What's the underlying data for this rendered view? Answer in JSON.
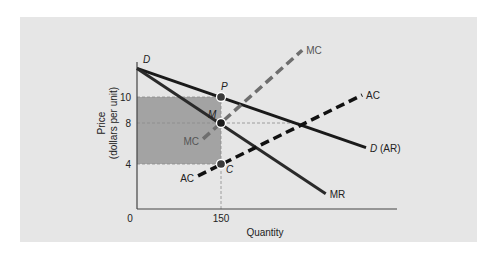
{
  "chart_data": {
    "type": "line",
    "title": "",
    "xlabel": "Quantity",
    "ylabel": [
      "Price",
      "(dollars per unit)"
    ],
    "xlim": [
      0,
      465
    ],
    "ylim": [
      0,
      13.8
    ],
    "x_ticks": [
      {
        "value": 0,
        "label": "0"
      },
      {
        "value": 150,
        "label": "150"
      }
    ],
    "y_ticks": [
      {
        "value": 10,
        "label": "10"
      },
      {
        "value": 8,
        "label": "8"
      },
      {
        "value": 4,
        "label": "4"
      }
    ],
    "grid": false,
    "colors": {
      "panel": "#e6e6e6",
      "shade": "#a3a3a3",
      "axis": "#444444",
      "demand": "#1a1a1a",
      "mr": "#2a2a2a",
      "mc": "#6e6e6e",
      "ac": "#111111",
      "guide": "#8a8a8a",
      "point": "#3a3a3a"
    },
    "series": [
      {
        "name": "D (AR)",
        "key": "demand",
        "style": "solid",
        "points": [
          [
            0,
            12.2
          ],
          [
            409,
            5.6
          ]
        ],
        "label": "D (AR)",
        "label_anchor": "end"
      },
      {
        "name": "MR",
        "key": "mr",
        "style": "solid",
        "points": [
          [
            0,
            12.2
          ],
          [
            337,
            1.35
          ]
        ],
        "label": "MR",
        "label_anchor": "end"
      },
      {
        "name": "MC",
        "key": "mc",
        "style": "dashed",
        "points": [
          [
            118,
            6.45
          ],
          [
            295,
            13.6
          ]
        ],
        "label": "MC",
        "label_anchor": "both"
      },
      {
        "name": "AC",
        "key": "ac",
        "style": "dashed",
        "points": [
          [
            109,
            2.95
          ],
          [
            402,
            10.15
          ]
        ],
        "label": "AC",
        "label_anchor": "both"
      }
    ],
    "shaded_region": {
      "name": "profit",
      "x": [
        0,
        150
      ],
      "y": [
        4,
        10
      ]
    },
    "guides": [
      {
        "from": [
          0,
          8
        ],
        "to": [
          290,
          8
        ]
      },
      {
        "from": [
          150,
          0
        ],
        "to": [
          150,
          10
        ]
      }
    ],
    "points": [
      {
        "label": "P",
        "q": 150,
        "p": 10
      },
      {
        "label": "M",
        "q": 150,
        "p": 8
      },
      {
        "label": "C",
        "q": 150,
        "p": 4
      }
    ],
    "curve_letters": [
      {
        "label": "D",
        "q": 0,
        "p": 12.2
      }
    ]
  }
}
